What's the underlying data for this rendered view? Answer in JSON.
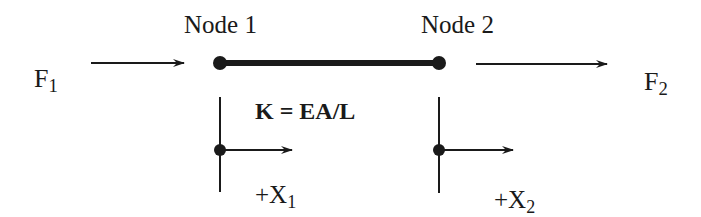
{
  "diagram": {
    "type": "spring-element",
    "nodes": [
      {
        "label": "Node 1",
        "x": 220,
        "y": 63
      },
      {
        "label": "Node 2",
        "x": 439,
        "y": 63
      }
    ],
    "forces": [
      {
        "symbol": "F",
        "subscript": "1",
        "direction": "right"
      },
      {
        "symbol": "F",
        "subscript": "2",
        "direction": "right"
      }
    ],
    "stiffness": {
      "label": "K = EA/L"
    },
    "displacements": [
      {
        "prefix": "+X",
        "subscript": "1",
        "direction": "right"
      },
      {
        "prefix": "+X",
        "subscript": "2",
        "direction": "right"
      }
    ],
    "colors": {
      "stroke": "#1a1a1a",
      "background": "#ffffff"
    }
  }
}
